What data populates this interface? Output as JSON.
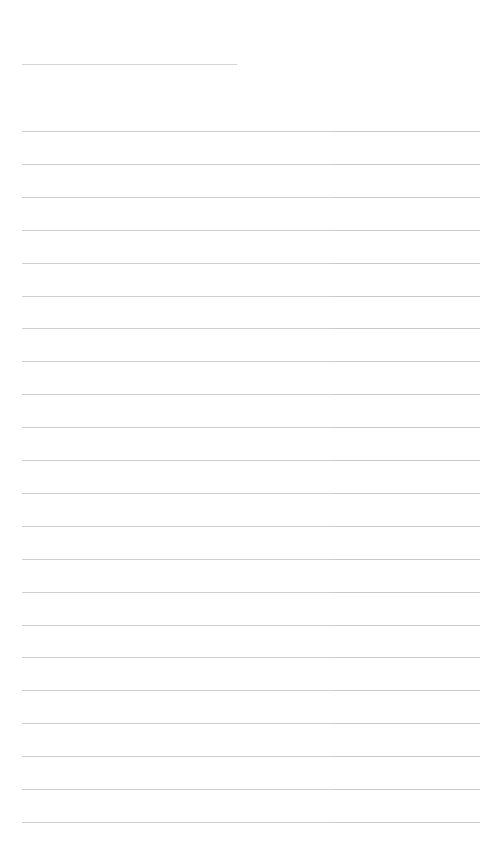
{
  "form": {
    "title_line": {
      "value": ""
    },
    "row_pitch_px": 32.9,
    "rows": [
      {
        "col_a": "",
        "col_b": ""
      },
      {
        "col_a": "",
        "col_b": ""
      },
      {
        "col_a": "",
        "col_b": ""
      },
      {
        "col_a": "",
        "col_b": ""
      },
      {
        "col_a": "",
        "col_b": ""
      },
      {
        "col_a": "",
        "col_b": ""
      },
      {
        "col_a": "",
        "col_b": ""
      },
      {
        "col_a": "",
        "col_b": ""
      },
      {
        "col_a": "",
        "col_b": ""
      },
      {
        "col_a": "",
        "col_b": ""
      },
      {
        "col_a": "",
        "col_b": ""
      },
      {
        "col_a": "",
        "col_b": ""
      },
      {
        "col_a": "",
        "col_b": ""
      },
      {
        "col_a": "",
        "col_b": ""
      },
      {
        "col_a": "",
        "col_b": ""
      },
      {
        "col_a": "",
        "col_b": ""
      },
      {
        "col_a": "",
        "col_b": ""
      },
      {
        "col_a": "",
        "col_b": ""
      },
      {
        "col_a": "",
        "col_b": ""
      },
      {
        "col_a": "",
        "col_b": ""
      },
      {
        "col_a": "",
        "col_b": ""
      },
      {
        "col_a": "",
        "col_b": ""
      }
    ]
  },
  "colors": {
    "background": "#ffffff",
    "line": "#cfcfcf"
  }
}
